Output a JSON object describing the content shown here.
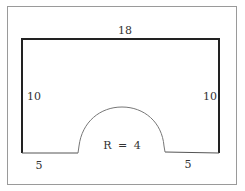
{
  "diagram": {
    "type": "geometry-figure",
    "labels": {
      "top_width": "18",
      "left_height": "10",
      "right_height": "10",
      "radius": "R = 4",
      "bottom_left": "5",
      "bottom_right": "5"
    },
    "dimensions": {
      "width": 18,
      "height": 10,
      "radius": 4,
      "bottom_left_segment": 5,
      "bottom_right_segment": 5
    },
    "colors": {
      "frame": "#999999",
      "shape_stroke": "#222222",
      "arc_stroke": "#777777",
      "text": "#333333"
    }
  }
}
